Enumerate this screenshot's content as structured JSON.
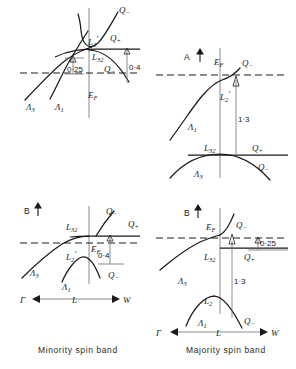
{
  "figure": {
    "captions": {
      "left": "Minority spin band",
      "right": "Majority spin band"
    },
    "axis": {
      "gamma": "Γ",
      "l": "L",
      "w": "W"
    }
  },
  "panels": [
    {
      "id": "top-left",
      "column": "minority",
      "row": "top",
      "marker": "",
      "labels": {
        "q_upper": "Q",
        "q_upper_sub": "−",
        "l2prime": "L",
        "l2prime_sub": "2",
        "q_plus": "Q",
        "q_plus_sub": "+",
        "l32": "L",
        "l32_sub": "32",
        "q_lower": "Q",
        "q_lower_sub": "−",
        "lambda3": "Λ",
        "lambda3_sub": "3",
        "lambda1": "Λ",
        "lambda1_sub": "1",
        "fermi": "E",
        "fermi_sub": "F"
      },
      "measurements": [
        {
          "name": "gap-0-25",
          "value": "0·25"
        },
        {
          "name": "gap-0-4",
          "value": "0·4"
        }
      ]
    },
    {
      "id": "top-right",
      "column": "majority",
      "row": "top",
      "marker": "A",
      "labels": {
        "fermi": "E",
        "fermi_sub": "F",
        "q_upper": "Q",
        "q_upper_sub": "−",
        "l2prime": "L",
        "l2prime_sub": "2",
        "lambda1": "Λ",
        "lambda1_sub": "1",
        "l32": "L",
        "l32_sub": "32",
        "q_plus": "Q",
        "q_plus_sub": "+",
        "lambda3": "Λ",
        "lambda3_sub": "3",
        "q_lower": "Q",
        "q_lower_sub": "−"
      },
      "measurements": [
        {
          "name": "gap-1-3",
          "value": "1·3"
        }
      ]
    },
    {
      "id": "bottom-left",
      "column": "minority",
      "row": "bottom",
      "marker": "B",
      "labels": {
        "l32": "L",
        "l32_sub": "32",
        "q_upper": "Q",
        "q_upper_sub": "−",
        "q_plus": "Q",
        "q_plus_sub": "+",
        "fermi": "E",
        "fermi_sub": "F",
        "lambda3": "Λ",
        "lambda3_sub": "3",
        "l2prime": "L",
        "l2prime_sub": "2",
        "lambda1": "Λ",
        "lambda1_sub": "1",
        "q_lower": "Q",
        "q_lower_sub": "−"
      },
      "measurements": [
        {
          "name": "gap-0-4",
          "value": "0·4"
        }
      ]
    },
    {
      "id": "bottom-right",
      "column": "majority",
      "row": "bottom",
      "marker": "B",
      "labels": {
        "fermi": "E",
        "fermi_sub": "F",
        "q_upper": "Q",
        "q_upper_sub": "−",
        "l32": "L",
        "l32_sub": "32",
        "q_plus": "Q",
        "q_plus_sub": "+",
        "lambda3": "Λ",
        "lambda3_sub": "3",
        "l2prime": "L",
        "l2prime_sub": "2",
        "lambda1": "Λ",
        "lambda1_sub": "1",
        "q_lower": "Q",
        "q_lower_sub": "−"
      },
      "measurements": [
        {
          "name": "gap-0-25",
          "value": "0·25"
        },
        {
          "name": "gap-1-3",
          "value": "1·3"
        }
      ]
    }
  ]
}
